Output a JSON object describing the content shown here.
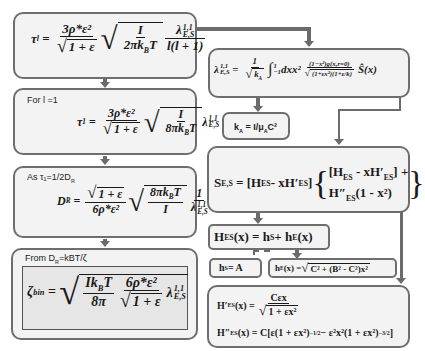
{
  "left": {
    "box1": {
      "lhs": "τ",
      "lhs_sub": "l",
      "num": "3ρ*ε²",
      "den_sqrt": "1 + ε",
      "sqrt_num": "I",
      "sqrt_den": "2πk",
      "sqrt_den_sub": "B",
      "sqrt_den_tail": "T",
      "lam": "λ",
      "lam_sup": "1,1",
      "lam_sub": "E,S",
      "lam_den": "l(l + 1)"
    },
    "box2": {
      "label": "For l =1",
      "lhs": "τ",
      "lhs_sub": "1",
      "num": "3ρ*ε²",
      "den_sqrt": "1 + ε",
      "sqrt_num": "I",
      "sqrt_den": "8πk",
      "sqrt_den_sub": "B",
      "sqrt_den_tail": "T",
      "lam": "λ",
      "lam_sup": "1,1",
      "lam_sub": "E,S"
    },
    "box3": {
      "label": "As τ₁=1/2D",
      "label_sub": "R",
      "lhs": "D",
      "lhs_sub": "R",
      "num_sqrt": "1 + ε",
      "den": "6ρ*ε²",
      "sqrt_num": "8πk",
      "sqrt_num_sub": "B",
      "sqrt_num_tail": "T",
      "sqrt_den": "I",
      "one": "1",
      "lam": "λ",
      "lam_sup": "1,1",
      "lam_sub": "E,S"
    },
    "box4": {
      "label": "From D",
      "label_sub": "R",
      "label_tail": "=kBT/ζ",
      "lhs": "ζ",
      "lhs_sub": "bin",
      "sqrt_num": "Ik",
      "sqrt_num_sub": "B",
      "sqrt_num_tail": "T",
      "sqrt_den": "8π",
      "num": "6ρ*ε²",
      "den_sqrt": "1 + ε",
      "lam": "λ",
      "lam_sup": "1,1",
      "lam_sub": "E,S"
    }
  },
  "right": {
    "lambda_box": {
      "lhs": "λ",
      "lhs_sup": "1,1",
      "lhs_sub": "E,S",
      "eq": "=",
      "one": "1",
      "kA": "k",
      "kA_sub": "A",
      "int": "∫",
      "int_upper": "1",
      "int_lower": "−1",
      "dxx": "dxx²",
      "num": "(1−x²)g(x,r=0)",
      "den": "(1+εx²)(1+ε/k)",
      "tail": "Ŝ(x)"
    },
    "ka_box": {
      "text": "k",
      "sub": "A",
      "tail": " = I/μ",
      "sub2": "A",
      "tail2": "C²"
    },
    "s_box": {
      "lhs": "S",
      "lhs_sub": "E,S",
      "bracket1": "[H",
      "b1_sub": "ES",
      "b1_mid": " - xH′",
      "b1_sub2": "ES",
      "b1_end": "]",
      "top_line": "[H",
      "top_sub": "ES",
      "top_mid": " - xH′",
      "top_sub2": "ES",
      "top_end": "] +",
      "bot_line": "H″",
      "bot_sub": "ES",
      "bot_tail": "(1 - x²)"
    },
    "h_box": {
      "lhs": "H",
      "lhs_sub": "ES",
      "mid": "(x) = h",
      "mid_sub": "S",
      "plus": " + h",
      "plus_sub": "E",
      "tail": "(x)"
    },
    "hs_box": {
      "lhs": "h",
      "sub": "S",
      "tail": " = A"
    },
    "he_box": {
      "lhs": "h",
      "sub": "E",
      "mid": "(x) = ",
      "arg": "C² + (B² - C²)x²"
    },
    "deriv_box": {
      "l1_lhs": "H′",
      "l1_sub": "ES",
      "l1_x": "(x) =",
      "l1_num": "Cεx",
      "l1_den": "1 + εx²",
      "l2_lhs": "H″",
      "l2_sub": "ES",
      "l2_rest": "(x) = C[ε(1 + εx²)",
      "l2_exp1": "−1/2",
      "l2_mid": " − ε²x²(1 + εx²)",
      "l2_exp2": "−3/2",
      "l2_end": "]"
    }
  }
}
